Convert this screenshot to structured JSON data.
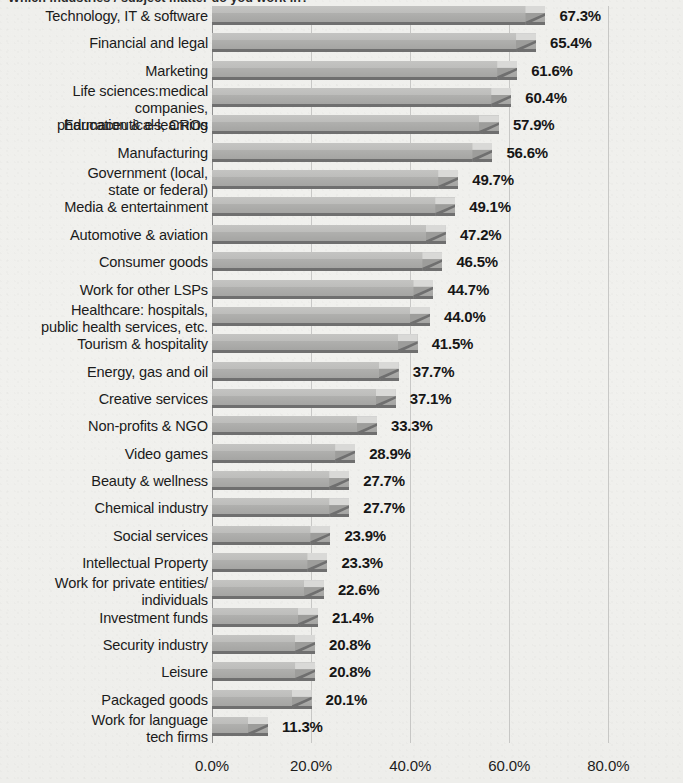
{
  "title": {
    "text": "Which industries / subject matter do you work in?",
    "cropped": true
  },
  "axis": {
    "x_ticks": [
      "0.0%",
      "20.0%",
      "40.0%",
      "60.0%",
      "80.0%"
    ],
    "x_tick_values": [
      0,
      20,
      40,
      60,
      80
    ],
    "xlim": [
      0,
      80
    ],
    "unit": "%"
  },
  "chart_data": {
    "type": "bar",
    "orientation": "horizontal",
    "title": "Which industries / subject matter do you work in?",
    "xlabel": "",
    "ylabel": "",
    "xlim": [
      0,
      80
    ],
    "grid": true,
    "legend": false,
    "value_labels": true,
    "bar_color": "#a8a8a6",
    "bar_top_color": "#c4c4c2",
    "bar_shadow_color": "#6f6f6f",
    "background_color": "#efefec",
    "categories": [
      "Technology, IT & software",
      "Financial and legal",
      "Marketing",
      "Life sciences:medical companies,\npharmaceuticals, CROs",
      "Education & e-learning",
      "Manufacturing",
      "Government (local,\nstate or federal)",
      "Media & entertainment",
      "Automotive & aviation",
      "Consumer goods",
      "Work for other LSPs",
      "Healthcare: hospitals,\npublic health services, etc.",
      "Tourism & hospitality",
      "Energy, gas and oil",
      "Creative services",
      "Non-profits & NGO",
      "Video games",
      "Beauty & wellness",
      "Chemical industry",
      "Social services",
      "Intellectual Property",
      "Work for private entities/\nindividuals",
      "Investment funds",
      "Security industry",
      "Leisure",
      "Packaged goods",
      "Work for language\ntech firms"
    ],
    "values": [
      67.3,
      65.4,
      61.6,
      60.4,
      57.9,
      56.6,
      49.7,
      49.1,
      47.2,
      46.5,
      44.7,
      44.0,
      41.5,
      37.7,
      37.1,
      33.3,
      28.9,
      27.7,
      27.7,
      23.9,
      23.3,
      22.6,
      21.4,
      20.8,
      20.8,
      20.1,
      11.3
    ],
    "value_label_texts": [
      "67.3%",
      "65.4%",
      "61.6%",
      "60.4%",
      "57.9%",
      "56.6%",
      "49.7%",
      "49.1%",
      "47.2%",
      "46.5%",
      "44.7%",
      "44.0%",
      "41.5%",
      "37.7%",
      "37.1%",
      "33.3%",
      "28.9%",
      "27.7%",
      "27.7%",
      "23.9%",
      "23.3%",
      "22.6%",
      "21.4%",
      "20.8%",
      "20.8%",
      "20.1%",
      "11.3%"
    ]
  }
}
